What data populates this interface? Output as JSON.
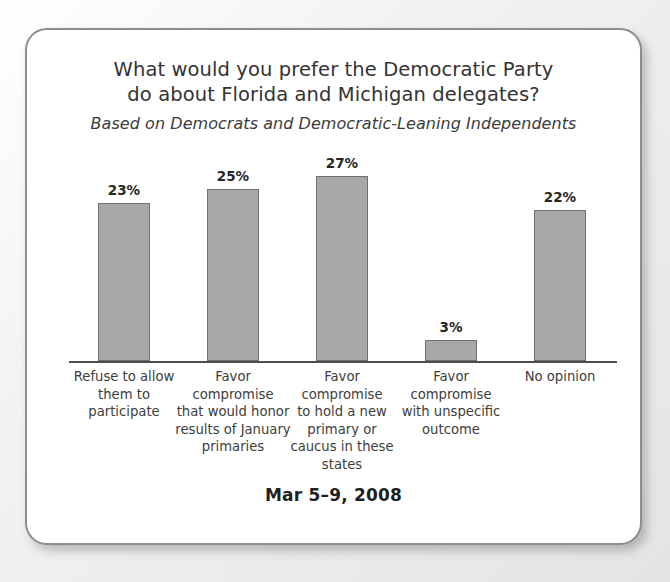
{
  "chart_data": {
    "type": "bar",
    "title": "What would you prefer the Democratic Party\ndo about Florida and Michigan delegates?",
    "subtitle": "Based on Democrats and Democratic-Leaning Independents",
    "categories": [
      "Refuse to allow\nthem to\nparticipate",
      "Favor\ncompromise\nthat would honor\nresults of January\nprimaries",
      "Favor\ncompromise\nto hold a new\nprimary or\ncaucus in these\nstates",
      "Favor\ncompromise\nwith unspecific\noutcome",
      "No opinion"
    ],
    "values": [
      23,
      25,
      27,
      3,
      22
    ],
    "value_labels": [
      "23%",
      "25%",
      "27%",
      "3%",
      "22%"
    ],
    "xlabel": "",
    "ylabel": "",
    "ylim": [
      0,
      30
    ],
    "grid": false,
    "legend": false,
    "bar_color": "#a8a8a8",
    "bar_border_color": "#6f6f6f",
    "axis_color": "#4d4d4d",
    "footer_date": "Mar 5–9, 2008"
  }
}
